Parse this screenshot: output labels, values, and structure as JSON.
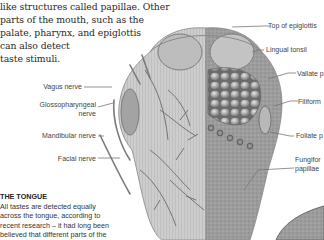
{
  "intro_text": {
    "lines": [
      "like structures called papillae. Other",
      "parts of the mouth, such as the",
      "palate, pharynx, and epiglottis",
      "can also detect",
      "taste stimuli."
    ]
  },
  "labels_left": {
    "vagus": "Vagus nerve",
    "glosso_1": "Glossopharyngeal",
    "glosso_2": "nerve",
    "mandibular": "Mandibular nerve",
    "facial": "Facial nerve"
  },
  "labels_right": {
    "epiglottis": "Top of epiglottis",
    "lingual": "Lingual tonsil",
    "vallate": "Vallate p",
    "filiform": "Filiform",
    "foliate": "Foliate p",
    "fungiform_1": "Fungifor",
    "fungiform_2": "papillae"
  },
  "caption": {
    "title": "THE TONGUE",
    "lines": [
      "All tastes are detected equally",
      "across the tongue, according to",
      "recent research – it had long been",
      "believed that different parts of the"
    ]
  },
  "illustration": {
    "subject": "tongue-anatomy-diagram",
    "colors": {
      "tissue": "#c9c9c9",
      "shade": "#8a8a8a",
      "nerve": "#6b6b6b",
      "ink": "#444444"
    }
  }
}
